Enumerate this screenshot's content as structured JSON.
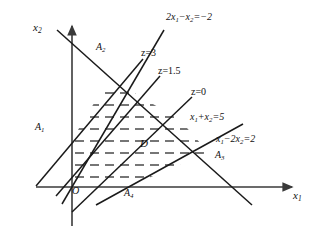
{
  "figure": {
    "background_color": "#ffffff",
    "line_color": "#1a1a1a",
    "axis_color": "#3a3a3a",
    "hatch_color": "#4a4a4a",
    "width": 316,
    "height": 232
  },
  "axes": {
    "x_axis_label": "x",
    "x_axis_subscript": "1",
    "y_axis_label": "x",
    "y_axis_subscript": "2",
    "origin_label": "O"
  },
  "vertices": [
    {
      "id": "A1",
      "base": "A",
      "sub": "1"
    },
    {
      "id": "A2",
      "base": "A",
      "sub": "2"
    },
    {
      "id": "A3",
      "base": "A",
      "sub": "3"
    },
    {
      "id": "A4",
      "base": "A",
      "sub": "4"
    }
  ],
  "region": {
    "label": "D",
    "description": "feasible region bounded by constraint lines, shown with horizontal dashed hatching"
  },
  "constraint_lines": [
    {
      "name": "constraint-2x1-minus-x2",
      "label_html": "2x<sub>1</sub>−x<sub>2</sub>=−2"
    },
    {
      "name": "constraint-x1-plus-x2",
      "label_html": "x<sub>1</sub>+x<sub>2</sub>=5"
    },
    {
      "name": "constraint-x1-minus-2x2",
      "label_html": "x<sub>1</sub>−2x<sub>2</sub>=2"
    }
  ],
  "objective_lines": [
    {
      "name": "objective-z-3",
      "label": "z=3"
    },
    {
      "name": "objective-z-1point5",
      "label": "z=1.5"
    },
    {
      "name": "objective-z-0",
      "label": "z=0"
    }
  ],
  "chart_data": {
    "type": "line",
    "xlabel": "x1",
    "ylabel": "x2",
    "grid": false,
    "legend": "none",
    "pixel_frame": {
      "origin_px": [
        72,
        187
      ],
      "x_axis_tip_px": [
        296,
        187
      ],
      "y_axis_tip_px": [
        72,
        21
      ]
    },
    "annotations": [
      {
        "text": "2x1-x2=-2",
        "px": [
          172,
          18
        ]
      },
      {
        "text": "z=3",
        "px": [
          146,
          54
        ]
      },
      {
        "text": "z=1.5",
        "px": [
          163,
          72
        ]
      },
      {
        "text": "z=0",
        "px": [
          196,
          93
        ]
      },
      {
        "text": "x1+x2=5",
        "px": [
          196,
          118
        ]
      },
      {
        "text": "x1-2x2=2",
        "px": [
          222,
          140
        ]
      },
      {
        "text": "A1",
        "px": [
          40,
          128
        ]
      },
      {
        "text": "A2",
        "px": [
          101,
          48
        ]
      },
      {
        "text": "A3",
        "px": [
          220,
          156
        ]
      },
      {
        "text": "A4",
        "px": [
          128,
          194
        ]
      },
      {
        "text": "D",
        "px": [
          143,
          143
        ]
      },
      {
        "text": "O",
        "px": [
          76,
          192
        ]
      },
      {
        "text": "x1",
        "px": [
          296,
          196
        ]
      },
      {
        "text": "x2",
        "px": [
          36,
          26
        ]
      }
    ],
    "series": [
      {
        "name": "2x1-x2=-2",
        "equation": "2*x1 - x2 = -2",
        "slope": 2,
        "intercept": 2,
        "pixel_endpoints": [
          [
            62,
            204
          ],
          [
            164,
            30
          ]
        ]
      },
      {
        "name": "x1+x2=5",
        "equation": "x1 + x2 = 5",
        "slope": -1,
        "intercept": 5,
        "pixel_endpoints": [
          [
            57,
            30
          ],
          [
            252,
            205
          ]
        ]
      },
      {
        "name": "x1-2x2=2",
        "equation": "x1 - 2*x2 = 2",
        "slope": 0.5,
        "intercept": -1,
        "pixel_endpoints": [
          [
            96,
            205
          ],
          [
            243,
            124
          ]
        ]
      },
      {
        "name": "z=3",
        "equation": "objective level line z = 3",
        "pixel_endpoints": [
          [
            36,
            186
          ],
          [
            143,
            59
          ]
        ]
      },
      {
        "name": "z=1.5",
        "equation": "objective level line z = 1.5",
        "pixel_endpoints": [
          [
            56,
            196
          ],
          [
            160,
            76
          ]
        ]
      },
      {
        "name": "z=0",
        "equation": "objective level line z = 0",
        "pixel_endpoints": [
          [
            72,
            212
          ],
          [
            192,
            97
          ]
        ]
      }
    ],
    "feasible_region": {
      "label": "D",
      "pixel_polygon": [
        [
          72,
          140
        ],
        [
          109,
          78
        ],
        [
          180,
          120
        ],
        [
          208,
          152
        ],
        [
          128,
          187
        ],
        [
          72,
          187
        ]
      ],
      "fill": "horizontal dashed hatching"
    },
    "hatch_lines_px_y": [
      93,
      105,
      117,
      129,
      141,
      153,
      165,
      177
    ]
  }
}
